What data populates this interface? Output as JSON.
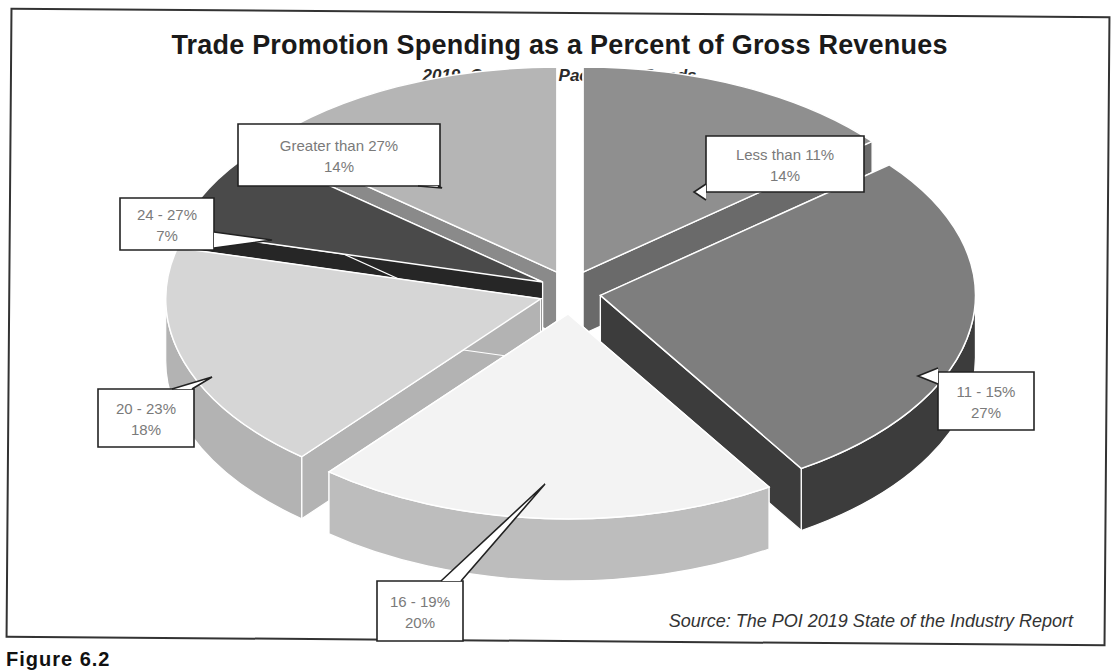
{
  "chart_data": {
    "type": "pie",
    "style": "3d-exploded",
    "title": "Trade Promotion Spending as a Percent of Gross Revenues",
    "subtitle": "2019, Consumer Packaged Goods",
    "source": "Source: The POI 2019 State of the Industry Report",
    "categories": [
      "Less than 11%",
      "11 - 15%",
      "16 - 19%",
      "20 - 23%",
      "24 - 27%",
      "Greater than 27%"
    ],
    "values": [
      14,
      27,
      20,
      18,
      7,
      14
    ],
    "value_labels": [
      "14%",
      "27%",
      "20%",
      "18%",
      "7%",
      "14%"
    ],
    "colors_top": [
      "#8f8f8f",
      "#7e7e7e",
      "#f3f3f3",
      "#d6d6d6",
      "#4a4a4a",
      "#b5b5b5"
    ],
    "colors_side": [
      "#6a6a6a",
      "#3c3c3c",
      "#bdbdbd",
      "#b3b3b3",
      "#262626",
      "#8a8a8a"
    ],
    "start_angle_deg": 0,
    "direction": "clockwise",
    "legend": "none (callout data labels)"
  },
  "callouts": [
    {
      "category": "Less than 11%",
      "value": "14%",
      "box": [
        706,
        136,
        158,
        56
      ],
      "anchor": [
        694,
        192
      ]
    },
    {
      "category": "11 - 15%",
      "value": "27%",
      "box": [
        938,
        372,
        96,
        58
      ],
      "anchor": [
        918,
        376
      ]
    },
    {
      "category": "16 - 19%",
      "value": "20%",
      "box": [
        377,
        581,
        86,
        60
      ],
      "anchor": [
        545,
        484
      ]
    },
    {
      "category": "20 - 23%",
      "value": "18%",
      "box": [
        98,
        389,
        96,
        58
      ],
      "anchor": [
        212,
        377
      ]
    },
    {
      "category": "24 - 27%",
      "value": "7%",
      "box": [
        120,
        198,
        94,
        52
      ],
      "anchor": [
        272,
        240
      ]
    },
    {
      "category": "Greater than 27%",
      "value": "14%",
      "box": [
        238,
        124,
        202,
        62
      ],
      "anchor": [
        442,
        188
      ]
    }
  ],
  "caption_fragment": "Figure 6.2 "
}
